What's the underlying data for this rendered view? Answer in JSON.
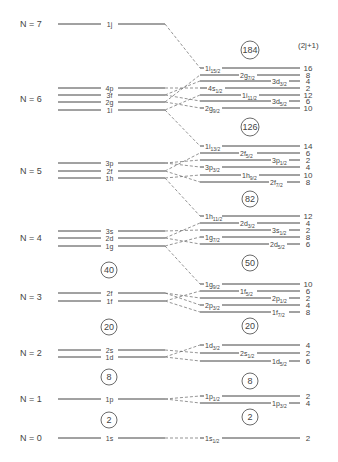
{
  "degeneracy_header": "(2j+1)",
  "oscillator_shells": [
    {
      "label": "N = 7",
      "y": 24,
      "levels": [
        {
          "name": "1j",
          "y": 24
        }
      ]
    },
    {
      "label": "N = 6",
      "y": 99,
      "levels": [
        {
          "name": "4p",
          "y": 88
        },
        {
          "name": "3f",
          "y": 95
        },
        {
          "name": "2g",
          "y": 102
        },
        {
          "name": "1i",
          "y": 110
        }
      ]
    },
    {
      "label": "N = 5",
      "y": 171,
      "levels": [
        {
          "name": "3p",
          "y": 163
        },
        {
          "name": "2f",
          "y": 171
        },
        {
          "name": "1h",
          "y": 178
        }
      ]
    },
    {
      "label": "N = 4",
      "y": 238,
      "levels": [
        {
          "name": "3s",
          "y": 231
        },
        {
          "name": "2d",
          "y": 238
        },
        {
          "name": "1g",
          "y": 246
        }
      ]
    },
    {
      "label": "N = 3",
      "y": 297,
      "levels": [
        {
          "name": "2f",
          "y": 293
        },
        {
          "name": "1f",
          "y": 301
        }
      ]
    },
    {
      "label": "N = 2",
      "y": 353,
      "levels": [
        {
          "name": "2s",
          "y": 350
        },
        {
          "name": "1d",
          "y": 357
        }
      ]
    },
    {
      "label": "N = 1",
      "y": 399,
      "levels": [
        {
          "name": "1p",
          "y": 399
        }
      ]
    },
    {
      "label": "N = 0",
      "y": 438,
      "levels": [
        {
          "name": "1s",
          "y": 438
        }
      ]
    }
  ],
  "split_levels": [
    {
      "orbital": "1i",
      "j": "15/2",
      "deg": "16",
      "y": 68,
      "from": 24,
      "lx": 205
    },
    {
      "orbital": "2g",
      "j": "7/2",
      "deg": "8",
      "y": 75,
      "from": 102,
      "lx": 240
    },
    {
      "orbital": "3d",
      "j": "3/2",
      "deg": "4",
      "y": 81,
      "from": 95,
      "lx": 272
    },
    {
      "orbital": "4s",
      "j": "1/2",
      "deg": "2",
      "y": 88,
      "from": 88,
      "lx": 208
    },
    {
      "orbital": "1i",
      "j": "11/2",
      "deg": "12",
      "y": 95,
      "from": 110,
      "lx": 242
    },
    {
      "orbital": "3d",
      "j": "5/2",
      "deg": "6",
      "y": 101,
      "from": 95,
      "lx": 272
    },
    {
      "orbital": "2g",
      "j": "9/2",
      "deg": "10",
      "y": 108,
      "from": 102,
      "lx": 205
    },
    {
      "orbital": "1i",
      "j": "13/2",
      "deg": "14",
      "y": 146,
      "from": 110,
      "lx": 205
    },
    {
      "orbital": "2f",
      "j": "5/2",
      "deg": "6",
      "y": 153,
      "from": 171,
      "lx": 240
    },
    {
      "orbital": "3p",
      "j": "1/2",
      "deg": "2",
      "y": 160,
      "from": 163,
      "lx": 272
    },
    {
      "orbital": "3p",
      "j": "3/2",
      "deg": "4",
      "y": 167,
      "from": 163,
      "lx": 205
    },
    {
      "orbital": "1h",
      "j": "9/2",
      "deg": "10",
      "y": 175,
      "from": 178,
      "lx": 242
    },
    {
      "orbital": "2f",
      "j": "7/2",
      "deg": "8",
      "y": 182,
      "from": 171,
      "lx": 270
    },
    {
      "orbital": "1h",
      "j": "11/2",
      "deg": "12",
      "y": 216,
      "from": 178,
      "lx": 205
    },
    {
      "orbital": "2d",
      "j": "3/2",
      "deg": "4",
      "y": 223,
      "from": 238,
      "lx": 240
    },
    {
      "orbital": "3s",
      "j": "1/2",
      "deg": "2",
      "y": 230,
      "from": 231,
      "lx": 272
    },
    {
      "orbital": "1g",
      "j": "7/2",
      "deg": "8",
      "y": 237,
      "from": 246,
      "lx": 205
    },
    {
      "orbital": "2d",
      "j": "5/2",
      "deg": "6",
      "y": 244,
      "from": 238,
      "lx": 270
    },
    {
      "orbital": "1g",
      "j": "9/2",
      "deg": "10",
      "y": 284,
      "from": 246,
      "lx": 205
    },
    {
      "orbital": "1f",
      "j": "5/2",
      "deg": "6",
      "y": 291,
      "from": 301,
      "lx": 240
    },
    {
      "orbital": "2p",
      "j": "1/2",
      "deg": "2",
      "y": 298,
      "from": 293,
      "lx": 272
    },
    {
      "orbital": "2p",
      "j": "3/2",
      "deg": "4",
      "y": 305,
      "from": 293,
      "lx": 205
    },
    {
      "orbital": "1f",
      "j": "7/2",
      "deg": "8",
      "y": 312,
      "from": 301,
      "lx": 272
    },
    {
      "orbital": "1d",
      "j": "3/2",
      "deg": "4",
      "y": 345,
      "from": 357,
      "lx": 205
    },
    {
      "orbital": "2s",
      "j": "1/2",
      "deg": "2",
      "y": 353,
      "from": 350,
      "lx": 240
    },
    {
      "orbital": "1d",
      "j": "5/2",
      "deg": "6",
      "y": 361,
      "from": 357,
      "lx": 272
    },
    {
      "orbital": "1p",
      "j": "1/2",
      "deg": "2",
      "y": 396,
      "from": 399,
      "lx": 205
    },
    {
      "orbital": "1p",
      "j": "3/2",
      "deg": "4",
      "y": 403,
      "from": 399,
      "lx": 272
    },
    {
      "orbital": "1s",
      "j": "1/2",
      "deg": "2",
      "y": 438,
      "from": 438,
      "lx": 205
    }
  ],
  "magic_numbers_left": [
    {
      "value": "40",
      "y": 270
    },
    {
      "value": "20",
      "y": 327
    },
    {
      "value": "8",
      "y": 377
    },
    {
      "value": "2",
      "y": 420
    }
  ],
  "magic_numbers_right": [
    {
      "value": "184",
      "y": 50
    },
    {
      "value": "126",
      "y": 127
    },
    {
      "value": "82",
      "y": 199
    },
    {
      "value": "50",
      "y": 263
    },
    {
      "value": "20",
      "y": 326
    },
    {
      "value": "8",
      "y": 381
    },
    {
      "value": "2",
      "y": 417
    }
  ]
}
